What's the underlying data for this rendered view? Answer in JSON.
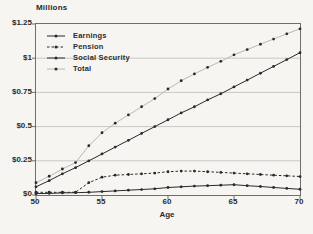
{
  "chart_data": {
    "type": "line",
    "title": "Millions",
    "xlabel": "Age",
    "ylabel": "",
    "xlim": [
      50,
      70
    ],
    "ylim": [
      0,
      1.25
    ],
    "grid": "horizontal",
    "legend_position": "top-left",
    "x": [
      50,
      51,
      52,
      53,
      54,
      55,
      56,
      57,
      58,
      59,
      60,
      61,
      62,
      63,
      64,
      65,
      66,
      67,
      68,
      69,
      70
    ],
    "x_tick_values": [
      50,
      55,
      60,
      65,
      70
    ],
    "x_tick_labels": [
      "50",
      "55",
      "60",
      "65",
      "70"
    ],
    "y_tick_values": [
      0,
      0.25,
      0.5,
      0.75,
      1,
      1.25
    ],
    "y_tick_labels": [
      "$0",
      "$0.25",
      "$0.5",
      "$0.75",
      "$1",
      "$1.25"
    ],
    "series": [
      {
        "name": "Earnings",
        "color": "#2a2a2a",
        "line": "solid",
        "values": [
          0.06,
          0.105,
          0.155,
          0.2,
          0.25,
          0.3,
          0.35,
          0.4,
          0.45,
          0.5,
          0.55,
          0.6,
          0.645,
          0.695,
          0.74,
          0.79,
          0.84,
          0.89,
          0.94,
          0.99,
          1.04
        ]
      },
      {
        "name": "Pension",
        "color": "#2a2a2a",
        "line": "dash-dot",
        "values": [
          0.02,
          0.02,
          0.02,
          0.02,
          0.09,
          0.13,
          0.145,
          0.15,
          0.155,
          0.16,
          0.17,
          0.175,
          0.175,
          0.17,
          0.165,
          0.16,
          0.155,
          0.15,
          0.145,
          0.14,
          0.135
        ]
      },
      {
        "name": "Social Security",
        "color": "#2a2a2a",
        "line": "solid",
        "values": [
          0.01,
          0.012,
          0.015,
          0.017,
          0.02,
          0.025,
          0.03,
          0.035,
          0.04,
          0.045,
          0.055,
          0.06,
          0.065,
          0.068,
          0.072,
          0.075,
          0.068,
          0.062,
          0.055,
          0.048,
          0.042
        ]
      },
      {
        "name": "Total",
        "color": "#b9b8b4",
        "line": "solid",
        "values": [
          0.09,
          0.137,
          0.19,
          0.237,
          0.36,
          0.455,
          0.525,
          0.585,
          0.645,
          0.705,
          0.775,
          0.835,
          0.885,
          0.933,
          0.977,
          1.025,
          1.063,
          1.102,
          1.14,
          1.178,
          1.215
        ]
      }
    ],
    "marker_color": "#2a2a2a",
    "gridline_color": "#c9c8c4",
    "frame_color": "#6e6e6a"
  }
}
